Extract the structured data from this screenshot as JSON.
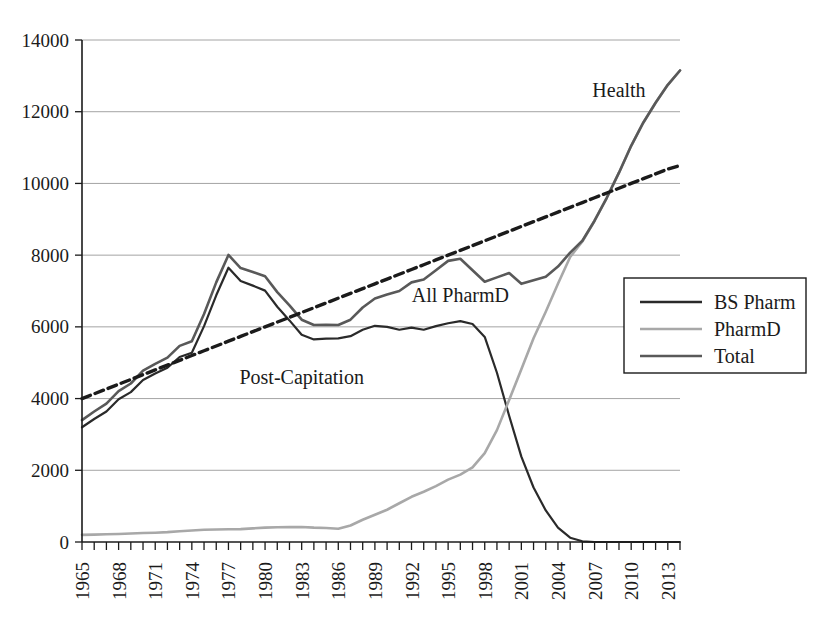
{
  "chart_data": {
    "type": "line",
    "title": "",
    "xlabel": "",
    "ylabel": "",
    "xlim": [
      1965,
      2014
    ],
    "ylim": [
      0,
      14000
    ],
    "grid": true,
    "legend_position": "right-middle",
    "ytick_labels": [
      "0",
      "2000",
      "4000",
      "6000",
      "8000",
      "10000",
      "12000",
      "14000"
    ],
    "ytick_values": [
      0,
      2000,
      4000,
      6000,
      8000,
      10000,
      12000,
      14000
    ],
    "xtick_labels": [
      "1965",
      "1968",
      "1971",
      "1974",
      "1977",
      "1980",
      "1983",
      "1986",
      "1989",
      "1992",
      "1995",
      "1998",
      "2001",
      "2004",
      "2007",
      "2010",
      "2013"
    ],
    "xtick_values": [
      1965,
      1968,
      1971,
      1974,
      1977,
      1980,
      1983,
      1986,
      1989,
      1992,
      1995,
      1998,
      2001,
      2004,
      2007,
      2010,
      2013
    ],
    "x": [
      1965,
      1966,
      1967,
      1968,
      1969,
      1970,
      1971,
      1972,
      1973,
      1974,
      1975,
      1976,
      1977,
      1978,
      1979,
      1980,
      1981,
      1982,
      1983,
      1984,
      1985,
      1986,
      1987,
      1988,
      1989,
      1990,
      1991,
      1992,
      1993,
      1994,
      1995,
      1996,
      1997,
      1998,
      1999,
      2000,
      2001,
      2002,
      2003,
      2004,
      2005,
      2006,
      2007,
      2008,
      2009,
      2010,
      2011,
      2012,
      2013,
      2014
    ],
    "series": [
      {
        "name": "BS Pharm",
        "color": "#2a2a2a",
        "style": "solid",
        "width": 2.2,
        "values": [
          3200,
          3430,
          3640,
          3980,
          4180,
          4520,
          4700,
          4860,
          5160,
          5280,
          6020,
          6880,
          7650,
          7280,
          7150,
          7010,
          6560,
          6180,
          5780,
          5650,
          5670,
          5680,
          5740,
          5920,
          6030,
          6000,
          5920,
          5980,
          5920,
          6020,
          6100,
          6160,
          6080,
          5720,
          4720,
          3520,
          2380,
          1520,
          880,
          400,
          120,
          20,
          0,
          0,
          0,
          0,
          0,
          0,
          0,
          0
        ]
      },
      {
        "name": "PharmD",
        "color": "#a8a8a8",
        "style": "solid",
        "width": 2.6,
        "values": [
          200,
          205,
          215,
          225,
          235,
          250,
          260,
          275,
          300,
          320,
          340,
          350,
          355,
          360,
          380,
          400,
          410,
          415,
          420,
          400,
          390,
          370,
          460,
          620,
          760,
          900,
          1080,
          1260,
          1400,
          1560,
          1740,
          1880,
          2080,
          2480,
          3120,
          3960,
          4820,
          5680,
          6420,
          7200,
          7950,
          8380,
          8960,
          9600,
          10300,
          11050,
          11700,
          12250,
          12750,
          13150
        ]
      },
      {
        "name": "Total",
        "color": "#595959",
        "style": "solid",
        "width": 2.6,
        "values": [
          3400,
          3640,
          3860,
          4210,
          4420,
          4780,
          4970,
          5140,
          5470,
          5600,
          6360,
          7240,
          8005,
          7640,
          7530,
          7410,
          6970,
          6600,
          6200,
          6050,
          6060,
          6050,
          6200,
          6540,
          6790,
          6900,
          7000,
          7240,
          7320,
          7580,
          7840,
          7900,
          7580,
          7260,
          7380,
          7500,
          7200,
          7300,
          7400,
          7680,
          8070,
          8400,
          8960,
          9600,
          10300,
          11050,
          11700,
          12250,
          12750,
          13150
        ]
      },
      {
        "name": "Trend",
        "color": "#1b1b1b",
        "style": "dashed",
        "width": 3.4,
        "values": [
          4000,
          4133,
          4266,
          4400,
          4533,
          4666,
          4800,
          4933,
          5066,
          5200,
          5333,
          5466,
          5600,
          5733,
          5866,
          6000,
          6133,
          6266,
          6400,
          6533,
          6666,
          6800,
          6933,
          7066,
          7200,
          7333,
          7466,
          7600,
          7733,
          7866,
          8000,
          8133,
          8266,
          8400,
          8533,
          8666,
          8800,
          8933,
          9066,
          9200,
          9333,
          9466,
          9600,
          9733,
          9866,
          10000,
          10133,
          10266,
          10400,
          10500
        ]
      }
    ],
    "annotations": [
      {
        "text": "Health",
        "x": 2009,
        "y": 12400
      },
      {
        "text": "All PharmD",
        "x": 1996,
        "y": 6700
      },
      {
        "text": "Post-Capitation",
        "x": 1983,
        "y": 4400
      }
    ],
    "legend_entries": [
      {
        "label": "BS Pharm",
        "color": "#2a2a2a",
        "style": "solid"
      },
      {
        "label": "PharmD",
        "color": "#a8a8a8",
        "style": "solid"
      },
      {
        "label": "Total",
        "color": "#595959",
        "style": "solid"
      }
    ]
  }
}
